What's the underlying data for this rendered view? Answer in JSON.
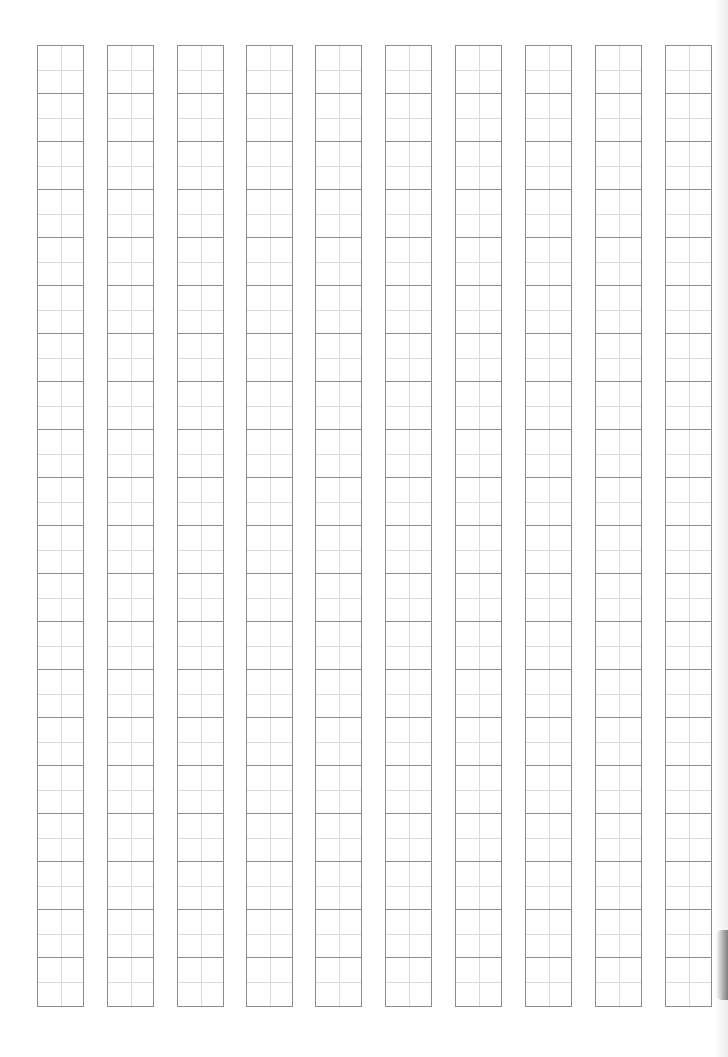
{
  "page": {
    "type": "tianzige-writing-grid",
    "columns": 10,
    "rows_per_column": 20,
    "cell_width_px": 47,
    "cell_height_px": 48,
    "column_lefts_px": [
      37,
      107,
      177,
      246,
      315,
      385,
      455,
      525,
      595,
      665
    ],
    "grid_top_px": 45,
    "colors": {
      "outer_line": "#8c8c8c",
      "guide_line": "#d9d9d9",
      "paper": "#ffffff"
    }
  }
}
